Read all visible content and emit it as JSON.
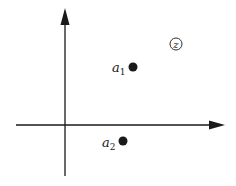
{
  "diagram": {
    "type": "coordinate-plane",
    "colors": {
      "ink": "#1a1a1a",
      "background": "#ffffff"
    },
    "axes": {
      "horizontal": {
        "x1": 16,
        "y": 125,
        "x2": 225
      },
      "vertical": {
        "x": 65,
        "y1": 176,
        "y2": 8
      }
    },
    "points": [
      {
        "id": "a1",
        "label": "a",
        "subscript": "1",
        "cx": 133,
        "cy": 67
      },
      {
        "id": "a2",
        "label": "a",
        "subscript": "2",
        "cx": 123,
        "cy": 141
      }
    ],
    "region_marker": {
      "label": "z",
      "cx": 176,
      "cy": 44,
      "r": 6
    }
  }
}
